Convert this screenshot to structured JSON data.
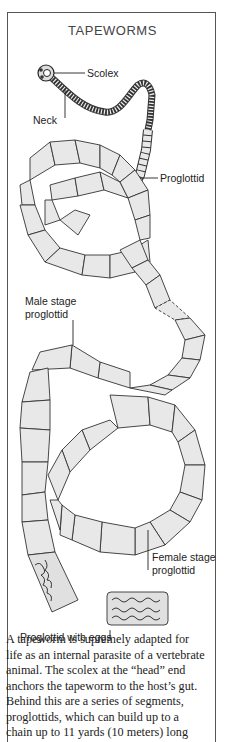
{
  "diagram": {
    "title": "TAPEWORMS",
    "labels": {
      "scolex": "Scolex",
      "neck": "Neck",
      "proglottid": "Proglottid",
      "male_line1": "Male stage",
      "male_line2": "proglottid",
      "female_line1": "Female stage",
      "female_line2": "proglottid",
      "eggs": "Proglottid with eggs"
    },
    "colors": {
      "segment_fill": "#e8e8e8",
      "outline": "#333333",
      "frame": "#555555"
    }
  },
  "caption": {
    "lines": [
      "A tapeworm is supremely adapted for",
      "life as an internal parasite of a vertebrate",
      "animal. The scolex at the “head” end",
      "anchors the tapeworm to the host’s gut.",
      "Behind this are a series of segments,",
      "proglottids, which can build up to a",
      "chain up to 11 yards (10 meters) long"
    ]
  }
}
